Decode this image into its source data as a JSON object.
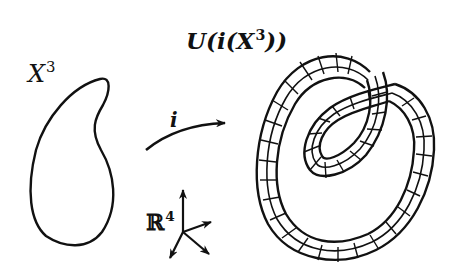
{
  "diagram": {
    "labels": {
      "manifold": {
        "base": "X",
        "exponent": "3"
      },
      "map": "i",
      "neighborhood": {
        "prefix": "U(",
        "inner": "i(",
        "base": "X",
        "exponent": "3",
        "suffix": "))"
      },
      "ambient_space": {
        "base": "ℝ",
        "exponent": "4"
      }
    },
    "nodes": [
      {
        "id": "manifold",
        "kind": "closed-curve",
        "label": "X³"
      },
      {
        "id": "embedding-arrow",
        "kind": "arrow",
        "label": "i"
      },
      {
        "id": "ambient-axes",
        "kind": "coordinate-frame",
        "label": "ℝ⁴",
        "arrow_count": 4
      },
      {
        "id": "tubular-neighborhood",
        "kind": "knotted-tube",
        "label": "U(i(X³))"
      }
    ],
    "edges": [
      {
        "from": "manifold",
        "to": "tubular-neighborhood",
        "label": "i"
      }
    ],
    "colors": {
      "stroke": "#111111",
      "background": "#ffffff"
    }
  }
}
